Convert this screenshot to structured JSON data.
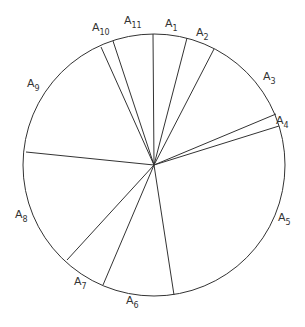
{
  "diagram": {
    "type": "partitioned-circle",
    "circle": {
      "cx": 154,
      "cy": 165,
      "r": 131,
      "stroke": "#333333"
    },
    "hub": {
      "x": 154,
      "y": 165
    },
    "spokes": [
      {
        "between": "A11-A1",
        "x": 153,
        "y": 34
      },
      {
        "between": "A1-A2",
        "x": 187,
        "y": 38
      },
      {
        "between": "A2-A3",
        "x": 214,
        "y": 49
      },
      {
        "between": "A3-A4",
        "x": 276,
        "y": 114
      },
      {
        "between": "A4-A5",
        "x": 279,
        "y": 126
      },
      {
        "between": "A5-A6",
        "x": 174,
        "y": 295
      },
      {
        "between": "A6-A7",
        "x": 103,
        "y": 285
      },
      {
        "between": "A7-A8",
        "x": 67,
        "y": 260
      },
      {
        "between": "A8-A9",
        "x": 26,
        "y": 152
      },
      {
        "between": "A9-A10",
        "x": 101,
        "y": 47
      },
      {
        "between": "A10-A11",
        "x": 113,
        "y": 41
      }
    ],
    "labels": [
      {
        "base": "A",
        "sub": "1",
        "x": 165,
        "y": 27
      },
      {
        "base": "A",
        "sub": "2",
        "x": 196,
        "y": 36
      },
      {
        "base": "A",
        "sub": "3",
        "x": 263,
        "y": 80
      },
      {
        "base": "A",
        "sub": "4",
        "x": 276,
        "y": 124
      },
      {
        "base": "A",
        "sub": "5",
        "x": 278,
        "y": 221
      },
      {
        "base": "A",
        "sub": "6",
        "x": 126,
        "y": 304
      },
      {
        "base": "A",
        "sub": "7",
        "x": 74,
        "y": 285
      },
      {
        "base": "A",
        "sub": "8",
        "x": 15,
        "y": 218
      },
      {
        "base": "A",
        "sub": "9",
        "x": 27,
        "y": 87
      },
      {
        "base": "A",
        "sub": "10",
        "x": 92,
        "y": 31
      },
      {
        "base": "A",
        "sub": "11",
        "x": 124,
        "y": 24
      }
    ]
  }
}
